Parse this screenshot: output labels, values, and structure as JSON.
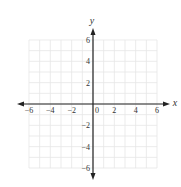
{
  "chart_data": {
    "type": "scatter",
    "title": "",
    "xlabel": "x",
    "ylabel": "y",
    "xlim": [
      -6,
      6
    ],
    "ylim": [
      -6,
      6
    ],
    "grid": true,
    "grid_step": 1,
    "x_ticks": [
      -6,
      -4,
      -2,
      0,
      2,
      4,
      6
    ],
    "x_tick_labels": [
      "−6",
      "−4",
      "−2",
      "0",
      "2",
      "4",
      "6"
    ],
    "y_ticks": [
      6,
      4,
      2,
      -2,
      -4,
      -6
    ],
    "y_tick_labels": [
      "6",
      "4",
      "2",
      "−2",
      "−4",
      "−6"
    ],
    "series": [],
    "legend": null
  },
  "style": {
    "axis_color": "#222222",
    "grid_color": "#e6e6e6",
    "label_color": "#333333",
    "background": "#ffffff"
  },
  "layout": {
    "origin_px": [
      93,
      104
    ],
    "unit_px": 10.67,
    "x_axis_extent_px": [
      17,
      170
    ],
    "y_axis_extent_px": [
      28,
      180
    ],
    "x_label_pos": [
      175,
      106
    ],
    "y_label_pos": [
      92,
      24
    ]
  }
}
